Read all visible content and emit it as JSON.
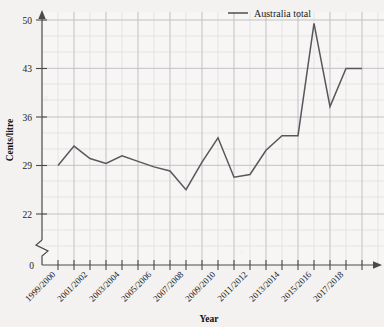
{
  "chart_data": {
    "type": "line",
    "title": "",
    "xlabel": "Year",
    "ylabel": "Cents/litre",
    "legend_position": "top-right",
    "grid": true,
    "axis_break": true,
    "ylim": [
      22,
      50
    ],
    "y_ticks": [
      "0",
      "22",
      "29",
      "36",
      "43",
      "50"
    ],
    "y_tick_values": [
      0,
      22,
      29,
      36,
      43,
      50
    ],
    "x_tick_labels": [
      "1999/2000",
      "2001/2002",
      "2003/2004",
      "2005/2006",
      "2007/2008",
      "2009/2010",
      "2011/2012",
      "2013/2014",
      "2015/2016",
      "2017/2018"
    ],
    "categories": [
      "1999/2000",
      "2000/2001",
      "2001/2002",
      "2002/2003",
      "2003/2004",
      "2004/2005",
      "2005/2006",
      "2006/2007",
      "2007/2008",
      "2008/2009",
      "2009/2010",
      "2010/2011",
      "2011/2012",
      "2012/2013",
      "2013/2014",
      "2014/2015",
      "2015/2016",
      "2016/2017",
      "2017/2018",
      "2018/2019"
    ],
    "series": [
      {
        "name": "Australia total",
        "color": "#58585c",
        "values": [
          29.0,
          31.8,
          30.0,
          29.3,
          30.4,
          29.6,
          28.8,
          28.2,
          25.5,
          29.5,
          33.0,
          27.3,
          27.7,
          31.2,
          33.3,
          33.3,
          49.5,
          37.5,
          43.0,
          43.0
        ]
      }
    ]
  },
  "legend": {
    "entries": [
      {
        "label": "Australia total"
      }
    ]
  },
  "axes": {
    "y_axis_title": "Cents/litre",
    "x_axis_title": "Year"
  }
}
